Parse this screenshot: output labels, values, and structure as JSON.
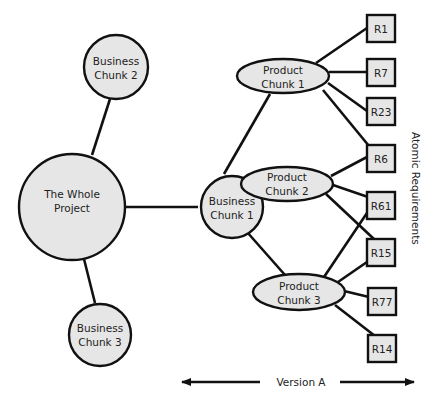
{
  "diagram": {
    "whole_project": {
      "line1": "The Whole",
      "line2": "Project"
    },
    "business_chunks": [
      {
        "id": "bc1",
        "line1": "Business",
        "line2": "Chunk 1"
      },
      {
        "id": "bc2",
        "line1": "Business",
        "line2": "Chunk 2"
      },
      {
        "id": "bc3",
        "line1": "Business",
        "line2": "Chunk 3"
      }
    ],
    "product_chunks": [
      {
        "id": "pc1",
        "line1": "Product",
        "line2": "Chunk 1"
      },
      {
        "id": "pc2",
        "line1": "Product",
        "line2": "Chunk 2"
      },
      {
        "id": "pc3",
        "line1": "Product",
        "line2": "Chunk 3"
      }
    ],
    "requirements": [
      "R1",
      "R7",
      "R23",
      "R6",
      "R61",
      "R15",
      "R77",
      "R14"
    ],
    "edges": [
      [
        "The Whole Project",
        "Business Chunk 1"
      ],
      [
        "The Whole Project",
        "Business Chunk 2"
      ],
      [
        "The Whole Project",
        "Business Chunk 3"
      ],
      [
        "Business Chunk 1",
        "Product Chunk 1"
      ],
      [
        "Business Chunk 1",
        "Product Chunk 2"
      ],
      [
        "Business Chunk 1",
        "Product Chunk 3"
      ],
      [
        "Product Chunk 1",
        "R1"
      ],
      [
        "Product Chunk 1",
        "R7"
      ],
      [
        "Product Chunk 1",
        "R23"
      ],
      [
        "Product Chunk 1",
        "R6"
      ],
      [
        "Product Chunk 2",
        "R6"
      ],
      [
        "Product Chunk 2",
        "R61"
      ],
      [
        "Product Chunk 2",
        "R15"
      ],
      [
        "Product Chunk 3",
        "R61"
      ],
      [
        "Product Chunk 3",
        "R15"
      ],
      [
        "Product Chunk 3",
        "R77"
      ],
      [
        "Product Chunk 3",
        "R14"
      ]
    ],
    "side_label": "Atomic Requirements",
    "version_label": "Version A"
  },
  "colors": {
    "node_fill": "#e6e6e6",
    "stroke": "#111111",
    "background": "#ffffff"
  }
}
